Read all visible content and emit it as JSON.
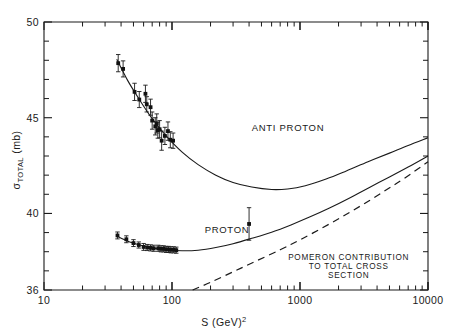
{
  "chart_data": {
    "type": "scatter",
    "title": "",
    "xlabel": "S (GeV)2",
    "xlabel_base": "S (GeV)",
    "xlabel_exponent": "2",
    "ylabel": "σ TOTAL (mb)",
    "ylabel_symbol": "σ",
    "ylabel_subscript": "TOTAL",
    "ylabel_unit": "(mb)",
    "xscale": "log",
    "yscale": "linear",
    "xlim": [
      10,
      10000
    ],
    "ylim": [
      36,
      50
    ],
    "grid": false,
    "legend_position": "inline-annotations",
    "x_tick_labels": [
      "10",
      "100",
      "1000",
      "10000"
    ],
    "x_tick_values": [
      10,
      100,
      1000,
      10000
    ],
    "y_tick_labels": [
      "36",
      "40",
      "45",
      "50"
    ],
    "y_tick_values": [
      36,
      40,
      45,
      50
    ],
    "y_minor_ticks": [
      37,
      38,
      39,
      41,
      42,
      43,
      44,
      46,
      47,
      48,
      49
    ],
    "annotations": [
      {
        "text": "ANTI PROTON",
        "x": 420,
        "y": 44.3
      },
      {
        "text": "PROTON",
        "x": 180,
        "y": 39.0
      },
      {
        "text": "POMERON CONTRIBUTION",
        "x": 2400,
        "y": 37.55
      },
      {
        "text": "TO TOTAL CROSS",
        "x": 2400,
        "y": 37.1
      },
      {
        "text": "SECTION",
        "x": 2400,
        "y": 36.65
      }
    ],
    "series": [
      {
        "name": "ANTI PROTON",
        "marker": "filled-square",
        "points": [
          {
            "x": 38.0,
            "y": 47.85,
            "yerr": 0.45
          },
          {
            "x": 41.5,
            "y": 47.55,
            "yerr": 0.42
          },
          {
            "x": 51.0,
            "y": 46.35,
            "yerr": 0.45
          },
          {
            "x": 55.5,
            "y": 45.95,
            "yerr": 0.42
          },
          {
            "x": 62.0,
            "y": 46.25,
            "yerr": 0.45
          },
          {
            "x": 63.5,
            "y": 45.7,
            "yerr": 0.4
          },
          {
            "x": 68.0,
            "y": 45.55,
            "yerr": 0.42
          },
          {
            "x": 70.0,
            "y": 44.85,
            "yerr": 0.45
          },
          {
            "x": 74.0,
            "y": 44.55,
            "yerr": 0.45
          },
          {
            "x": 76.0,
            "y": 44.7,
            "yerr": 0.5
          },
          {
            "x": 77.5,
            "y": 44.35,
            "yerr": 0.42
          },
          {
            "x": 80.0,
            "y": 44.4,
            "yerr": 0.45
          },
          {
            "x": 83.0,
            "y": 43.8,
            "yerr": 0.5
          },
          {
            "x": 88.0,
            "y": 44.05,
            "yerr": 0.45
          },
          {
            "x": 93.0,
            "y": 44.3,
            "yerr": 0.48
          },
          {
            "x": 97.0,
            "y": 43.85,
            "yerr": 0.42
          },
          {
            "x": 102.0,
            "y": 43.8,
            "yerr": 0.4
          }
        ]
      },
      {
        "name": "PROTON",
        "marker": "filled-square",
        "points": [
          {
            "x": 37.5,
            "y": 38.85,
            "yerr": 0.18
          },
          {
            "x": 44.0,
            "y": 38.65,
            "yerr": 0.18
          },
          {
            "x": 50.0,
            "y": 38.45,
            "yerr": 0.18
          },
          {
            "x": 55.0,
            "y": 38.35,
            "yerr": 0.16
          },
          {
            "x": 60.0,
            "y": 38.25,
            "yerr": 0.18
          },
          {
            "x": 64.0,
            "y": 38.22,
            "yerr": 0.16
          },
          {
            "x": 68.0,
            "y": 38.2,
            "yerr": 0.16
          },
          {
            "x": 72.0,
            "y": 38.18,
            "yerr": 0.16
          },
          {
            "x": 78.0,
            "y": 38.18,
            "yerr": 0.16
          },
          {
            "x": 82.0,
            "y": 38.15,
            "yerr": 0.16
          },
          {
            "x": 86.0,
            "y": 38.15,
            "yerr": 0.16
          },
          {
            "x": 90.0,
            "y": 38.12,
            "yerr": 0.16
          },
          {
            "x": 94.0,
            "y": 38.12,
            "yerr": 0.16
          },
          {
            "x": 98.0,
            "y": 38.1,
            "yerr": 0.16
          },
          {
            "x": 103.0,
            "y": 38.1,
            "yerr": 0.16
          },
          {
            "x": 108.0,
            "y": 38.08,
            "yerr": 0.16
          },
          {
            "x": 400.0,
            "y": 39.45,
            "yerr": 0.85
          }
        ]
      }
    ],
    "curves": [
      {
        "name": "anti-proton-fit",
        "style": "solid",
        "points": [
          {
            "x": 37.0,
            "y": 48.05
          },
          {
            "x": 45.0,
            "y": 46.95
          },
          {
            "x": 55.0,
            "y": 46.0
          },
          {
            "x": 70.0,
            "y": 44.95
          },
          {
            "x": 90.0,
            "y": 44.05
          },
          {
            "x": 120.0,
            "y": 43.2
          },
          {
            "x": 160.0,
            "y": 42.55
          },
          {
            "x": 220.0,
            "y": 42.0
          },
          {
            "x": 300.0,
            "y": 41.62
          },
          {
            "x": 420.0,
            "y": 41.38
          },
          {
            "x": 600.0,
            "y": 41.25
          },
          {
            "x": 800.0,
            "y": 41.28
          },
          {
            "x": 1100.0,
            "y": 41.45
          },
          {
            "x": 1600.0,
            "y": 41.8
          },
          {
            "x": 2300.0,
            "y": 42.22
          },
          {
            "x": 3400.0,
            "y": 42.7
          },
          {
            "x": 5000.0,
            "y": 43.15
          },
          {
            "x": 7000.0,
            "y": 43.55
          },
          {
            "x": 10000.0,
            "y": 43.95
          }
        ]
      },
      {
        "name": "proton-fit",
        "style": "solid",
        "points": [
          {
            "x": 37.0,
            "y": 38.82
          },
          {
            "x": 45.0,
            "y": 38.55
          },
          {
            "x": 55.0,
            "y": 38.36
          },
          {
            "x": 70.0,
            "y": 38.2
          },
          {
            "x": 90.0,
            "y": 38.1
          },
          {
            "x": 120.0,
            "y": 38.05
          },
          {
            "x": 160.0,
            "y": 38.08
          },
          {
            "x": 220.0,
            "y": 38.22
          },
          {
            "x": 300.0,
            "y": 38.42
          },
          {
            "x": 420.0,
            "y": 38.7
          },
          {
            "x": 600.0,
            "y": 39.02
          },
          {
            "x": 850.0,
            "y": 39.4
          },
          {
            "x": 1200.0,
            "y": 39.82
          },
          {
            "x": 1700.0,
            "y": 40.28
          },
          {
            "x": 2400.0,
            "y": 40.78
          },
          {
            "x": 3400.0,
            "y": 41.32
          },
          {
            "x": 5000.0,
            "y": 41.9
          },
          {
            "x": 7000.0,
            "y": 42.42
          },
          {
            "x": 10000.0,
            "y": 43.0
          }
        ]
      },
      {
        "name": "pomeron-contribution",
        "style": "dashed",
        "points": [
          {
            "x": 145.0,
            "y": 36.0
          },
          {
            "x": 200.0,
            "y": 36.4
          },
          {
            "x": 300.0,
            "y": 36.95
          },
          {
            "x": 450.0,
            "y": 37.5
          },
          {
            "x": 700.0,
            "y": 38.1
          },
          {
            "x": 1000.0,
            "y": 38.62
          },
          {
            "x": 1500.0,
            "y": 39.25
          },
          {
            "x": 2200.0,
            "y": 39.88
          },
          {
            "x": 3200.0,
            "y": 40.52
          },
          {
            "x": 4600.0,
            "y": 41.18
          },
          {
            "x": 6500.0,
            "y": 41.82
          },
          {
            "x": 10000.0,
            "y": 42.7
          }
        ]
      }
    ],
    "colors": {
      "foreground": "#1a1a1a",
      "background": "#ffffff",
      "marker": "#111111"
    }
  }
}
